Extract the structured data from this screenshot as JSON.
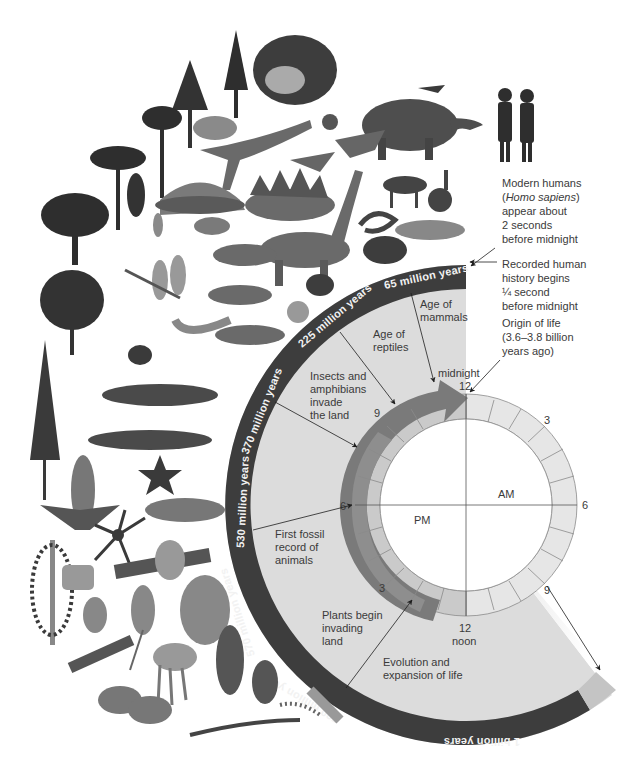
{
  "title_hidden": "",
  "timeline_band": {
    "color": "#3d3d3d",
    "labels": [
      {
        "id": "65my",
        "text": "65 million years"
      },
      {
        "id": "225my",
        "text": "225 million years"
      },
      {
        "id": "370my",
        "text": "370 million years"
      },
      {
        "id": "530my",
        "text": "530 million years"
      },
      {
        "id": "570my",
        "text": "570 million years"
      },
      {
        "id": "780my",
        "text": "780 million years"
      },
      {
        "id": "1by",
        "text": "1 billion years"
      }
    ]
  },
  "events": {
    "mammals": [
      "Age of",
      "mammals"
    ],
    "reptiles": [
      "Age of",
      "reptiles"
    ],
    "insects": [
      "Insects and",
      "amphibians",
      "invade",
      "the land"
    ],
    "fossil": [
      "First fossil",
      "record of",
      "animals"
    ],
    "plants": [
      "Plants begin",
      "invading",
      "land"
    ],
    "evolution": [
      "Evolution and",
      "expansion of life"
    ]
  },
  "clock": {
    "midnight_label": "midnight",
    "noon_label": "noon",
    "am_label": "AM",
    "pm_label": "PM",
    "hours": {
      "top": "12",
      "right_upper": "3",
      "right": "6",
      "right_lower": "9",
      "bottom": "12",
      "left_lower": "3",
      "left": "6",
      "left_upper": "9"
    },
    "colors": {
      "ring_light": "#e2e2e2",
      "ring_pm": "#c9c9c9",
      "arrow": "#7a7a7a",
      "sector": "#dedede"
    }
  },
  "annotations": {
    "humans": [
      "Modern humans",
      "(Homo sapiens)",
      "appear about",
      "2 seconds",
      "before midnight"
    ],
    "history": [
      "Recorded human",
      "history begins",
      "¼ second",
      "before midnight"
    ],
    "origin": [
      "Origin of life",
      "(3.6–3.8 billion",
      "years ago)"
    ]
  },
  "illustrations": [
    "conifer-trees",
    "magnolia",
    "palm-trees",
    "ginkgo",
    "velociraptor",
    "dimetrodon",
    "stegosaurus",
    "brachiosaurus",
    "mammoth",
    "bird",
    "butterfly",
    "pterosaur",
    "rabbit",
    "horse",
    "snake",
    "turtle",
    "whale",
    "rodent",
    "dragonfly",
    "amphibians",
    "centipede",
    "spider",
    "fish",
    "shark",
    "starfish",
    "eurypterid",
    "trilobite",
    "jellyfish",
    "sponges",
    "worms",
    "leaves",
    "human-figures"
  ]
}
